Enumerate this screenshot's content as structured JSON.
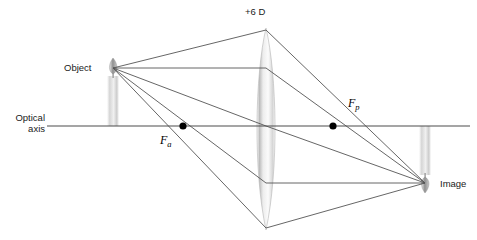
{
  "diagram": {
    "labels": {
      "lens_power": "+6 D",
      "object": "Object",
      "optical_axis_line1": "Optical",
      "optical_axis_line2": "axis",
      "focal_anterior": "F",
      "focal_anterior_sub": "a",
      "focal_posterior": "F",
      "focal_posterior_sub": "p",
      "image": "Image"
    },
    "colors": {
      "ray": "#555555",
      "axis": "#4d4d4d",
      "dot": "#000000",
      "lens_light": "#f2f2f2",
      "lens_mid": "#cfcfcf",
      "lens_edge": "#a8a8a8",
      "candle_body": "#d9d9d9",
      "flame": "#8c8c8c",
      "text": "#1a1a1a",
      "background": "#ffffff"
    },
    "geometry": {
      "lens_x": 266,
      "lens_top_y": 28,
      "lens_bottom_y": 230,
      "axis_y": 126,
      "axis_x_start": 47,
      "axis_x_end": 470,
      "object_tip": [
        113,
        68
      ],
      "object_base": [
        113,
        126
      ],
      "image_tip": [
        425,
        183
      ],
      "image_base": [
        425,
        126
      ],
      "focal_anterior_point": [
        183,
        126
      ],
      "focal_posterior_point": [
        333,
        126
      ]
    },
    "rays": [
      {
        "name": "parallel-ray",
        "description": "Ray from object tip parallel to optical axis, refracted through posterior focal point to image tip",
        "points": [
          [
            113,
            68
          ],
          [
            266,
            68
          ],
          [
            425,
            183
          ]
        ]
      },
      {
        "name": "upper-marginal-ray",
        "description": "Ray from object tip to upper lens margin, refracted to image tip",
        "points": [
          [
            113,
            68
          ],
          [
            266,
            30
          ],
          [
            425,
            183
          ]
        ]
      },
      {
        "name": "central-ray",
        "description": "Ray from object tip through the optical centre of the lens to image tip",
        "points": [
          [
            113,
            68
          ],
          [
            266,
            126
          ],
          [
            425,
            183
          ]
        ]
      },
      {
        "name": "focal-ray",
        "description": "Ray from object tip through anterior focal point, emerging parallel to optical axis",
        "points": [
          [
            113,
            68
          ],
          [
            266,
            183
          ],
          [
            425,
            183
          ]
        ]
      },
      {
        "name": "lower-marginal-ray",
        "description": "Ray from object tip to lower lens margin, refracted to image tip",
        "points": [
          [
            113,
            68
          ],
          [
            266,
            228
          ],
          [
            425,
            183
          ]
        ]
      }
    ]
  }
}
